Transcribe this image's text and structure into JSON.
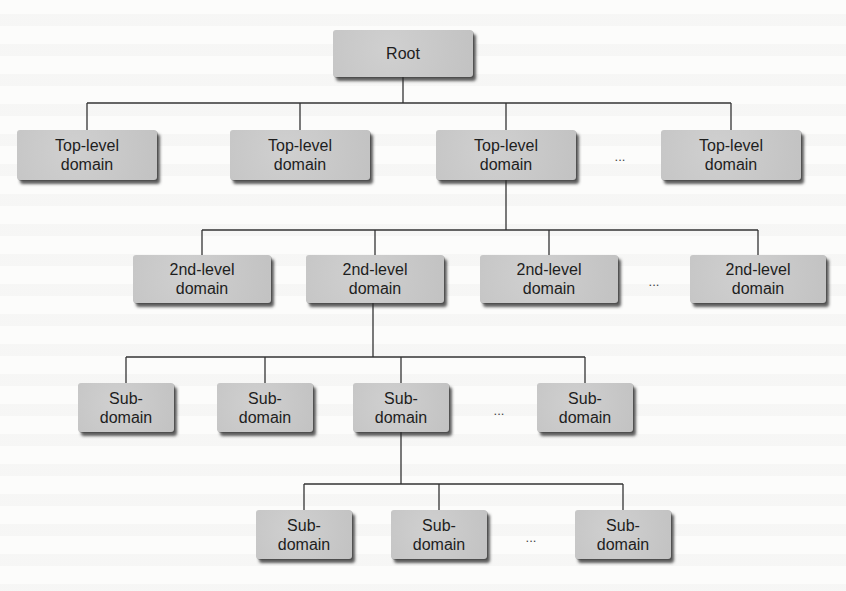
{
  "diagram": {
    "type": "tree",
    "root": {
      "label": "Root",
      "box": {
        "x": 333,
        "y": 30,
        "w": 140,
        "h": 47
      }
    },
    "levels": [
      {
        "name": "top-level",
        "bus_y": 103,
        "parent_x": 403,
        "parent_bottom": 77,
        "nodes": [
          {
            "label": "Top-level\ndomain",
            "box": {
              "x": 17,
              "y": 130,
              "w": 140,
              "h": 50
            }
          },
          {
            "label": "Top-level\ndomain",
            "box": {
              "x": 230,
              "y": 130,
              "w": 140,
              "h": 50
            }
          },
          {
            "label": "Top-level\ndomain",
            "box": {
              "x": 436,
              "y": 130,
              "w": 140,
              "h": 50
            }
          },
          {
            "label": "Top-level\ndomain",
            "box": {
              "x": 661,
              "y": 130,
              "w": 140,
              "h": 50
            }
          }
        ],
        "ellipsis": {
          "text": "...",
          "x": 620,
          "y": 156
        }
      },
      {
        "name": "second-level",
        "bus_y": 230,
        "parent_x": 506,
        "parent_bottom": 180,
        "nodes": [
          {
            "label": "2nd-level\ndomain",
            "box": {
              "x": 133,
              "y": 255,
              "w": 138,
              "h": 48
            }
          },
          {
            "label": "2nd-level\ndomain",
            "box": {
              "x": 306,
              "y": 255,
              "w": 138,
              "h": 48
            }
          },
          {
            "label": "2nd-level\ndomain",
            "box": {
              "x": 480,
              "y": 255,
              "w": 138,
              "h": 48
            }
          },
          {
            "label": "2nd-level\ndomain",
            "box": {
              "x": 690,
              "y": 255,
              "w": 136,
              "h": 48
            }
          }
        ],
        "ellipsis": {
          "text": "...",
          "x": 654,
          "y": 281
        }
      },
      {
        "name": "subdomain-1",
        "bus_y": 357,
        "parent_x": 373,
        "parent_bottom": 303,
        "nodes": [
          {
            "label": "Sub-\ndomain",
            "box": {
              "x": 78,
              "y": 383,
              "w": 96,
              "h": 49
            }
          },
          {
            "label": "Sub-\ndomain",
            "box": {
              "x": 217,
              "y": 383,
              "w": 96,
              "h": 49
            }
          },
          {
            "label": "Sub-\ndomain",
            "box": {
              "x": 353,
              "y": 383,
              "w": 96,
              "h": 49
            }
          },
          {
            "label": "Sub-\ndomain",
            "box": {
              "x": 537,
              "y": 383,
              "w": 96,
              "h": 49
            }
          }
        ],
        "ellipsis": {
          "text": "...",
          "x": 499,
          "y": 410
        }
      },
      {
        "name": "subdomain-2",
        "bus_y": 484,
        "parent_x": 401,
        "parent_bottom": 432,
        "nodes": [
          {
            "label": "Sub-\ndomain",
            "box": {
              "x": 256,
              "y": 510,
              "w": 96,
              "h": 49
            }
          },
          {
            "label": "Sub-\ndomain",
            "box": {
              "x": 391,
              "y": 510,
              "w": 96,
              "h": 49
            }
          },
          {
            "label": "Sub-\ndomain",
            "box": {
              "x": 575,
              "y": 510,
              "w": 96,
              "h": 49
            }
          }
        ],
        "ellipsis": {
          "text": "...",
          "x": 531,
          "y": 537
        }
      }
    ],
    "colors": {
      "node_fill": "#c9c9c9",
      "node_text": "#1e1e1e",
      "edge": "#333333",
      "background": "#fcfcfb"
    }
  }
}
